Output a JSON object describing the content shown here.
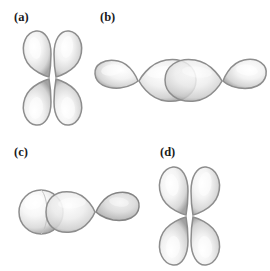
{
  "figure": {
    "background_color": "#ffffff",
    "lobe_fill_light": "#fbfbfb",
    "lobe_fill_mid": "#e4e4e4",
    "lobe_edge": "#8d8d8d",
    "lobe_edge_dark": "#6e6e6e",
    "outline_color": "#9a9a9a",
    "label_color": "#1b1b1b"
  },
  "panels": [
    {
      "id": "a",
      "label": "(a)",
      "orbital_type": "p-p side-on overlap",
      "orientation": "vertical",
      "lobe_count": 4,
      "description": "Two vertical p orbitals positioned side by side, lobes touching laterally"
    },
    {
      "id": "b",
      "label": "(b)",
      "orbital_type": "p-p end-on overlap",
      "orientation": "horizontal",
      "lobe_count": 4,
      "description": "Two horizontal p orbitals meeting head-on, inner lobes overlapping at the center"
    },
    {
      "id": "c",
      "label": "(c)",
      "orbital_type": "s-p end-on overlap",
      "orientation": "horizontal",
      "lobe_count": 3,
      "description": "A spherical s orbital overlapping the inner lobe of a horizontal p orbital"
    },
    {
      "id": "d",
      "label": "(d)",
      "orbital_type": "p-p side-on overlap",
      "orientation": "vertical",
      "lobe_count": 4,
      "description": "Two vertical p orbitals positioned side by side, lobes touching laterally"
    }
  ]
}
